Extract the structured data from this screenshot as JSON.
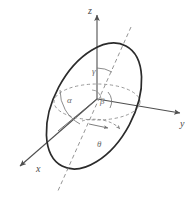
{
  "figure": {
    "kind": "3d-coordinate-diagram",
    "background_color": "#ffffff",
    "stroke_color": "#3a3a3a",
    "axis_color": "#4f4f4f",
    "dash_color": "#8a8a8a",
    "ellipse_color": "#2b2b2b",
    "axes": [
      {
        "id": "z",
        "label": "z",
        "direction": "up",
        "label_x": 88,
        "label_y": 14
      },
      {
        "id": "y",
        "label": "y",
        "direction": "right",
        "label_x": 180,
        "label_y": 127
      },
      {
        "id": "x",
        "label": "x",
        "direction": "down-left",
        "label_x": 36,
        "label_y": 172
      }
    ],
    "angles": [
      {
        "id": "alpha",
        "label": "α",
        "label_x": 67,
        "label_y": 103,
        "between": "x-axis and line in plane"
      },
      {
        "id": "beta",
        "label": "β",
        "label_x": 100,
        "label_y": 104,
        "between": "y-axis and line in plane"
      },
      {
        "id": "gamma",
        "label": "γ",
        "label_x": 92,
        "label_y": 74,
        "between": "z-axis and dashed normal"
      },
      {
        "id": "theta",
        "label": "θ",
        "label_x": 97,
        "label_y": 147,
        "between": "azimuth in xy-plane"
      }
    ],
    "origin": {
      "x": 97,
      "y": 99
    },
    "elements": [
      {
        "name": "inclined-ellipse",
        "style": "solid",
        "note": "large tilted ellipse centered near origin"
      },
      {
        "name": "normal-dashed-line",
        "style": "dashed",
        "note": "axis perpendicular to the inclined plane"
      },
      {
        "name": "horizontal-dashed-circle",
        "style": "dashed",
        "note": "reference circle in the xy-plane"
      },
      {
        "name": "alpha-arc",
        "style": "solid-thin"
      },
      {
        "name": "beta-arc",
        "style": "solid-thin"
      },
      {
        "name": "gamma-arc",
        "style": "solid-thin"
      },
      {
        "name": "theta-arc",
        "style": "dashed-arrow"
      },
      {
        "name": "in-plane-radius",
        "style": "solid-arrow"
      }
    ]
  }
}
